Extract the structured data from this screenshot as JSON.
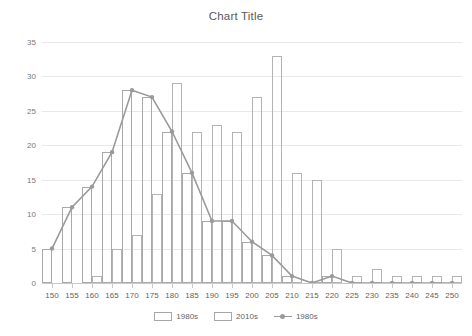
{
  "chart_data": {
    "type": "bar",
    "title": "Chart Title",
    "xlabel": "",
    "ylabel": "",
    "xlim": [
      150,
      250
    ],
    "ylim": [
      0,
      35
    ],
    "ytick_step": 5,
    "xtick_step": 5,
    "grid": true,
    "legend_position": "bottom",
    "categories": [
      150,
      155,
      160,
      165,
      170,
      175,
      180,
      185,
      190,
      195,
      200,
      205,
      210,
      215,
      220,
      225,
      230,
      235,
      240,
      245,
      250
    ],
    "yticks": [
      0,
      5,
      10,
      15,
      20,
      25,
      30,
      35
    ],
    "xticks": [
      150,
      155,
      160,
      165,
      170,
      175,
      180,
      185,
      190,
      195,
      200,
      205,
      210,
      215,
      220,
      225,
      230,
      235,
      240,
      245,
      250
    ],
    "series": [
      {
        "name": "1980s",
        "kind": "bar",
        "color": "#a9a9a9",
        "values": [
          5,
          11,
          14,
          19,
          28,
          27,
          22,
          16,
          9,
          9,
          6,
          4,
          1,
          0,
          1,
          0,
          0,
          0,
          0,
          0,
          0
        ]
      },
      {
        "name": "2010s",
        "kind": "bar",
        "color": "#b3b3b3",
        "values": [
          0,
          0,
          1,
          5,
          7,
          13,
          29,
          22,
          23,
          22,
          27,
          33,
          16,
          15,
          5,
          1,
          2,
          1,
          1,
          1,
          1
        ]
      },
      {
        "name": "1980s",
        "kind": "line",
        "color": "#9a9a9a",
        "values": [
          5,
          11,
          14,
          19,
          28,
          27,
          22,
          16,
          9,
          9,
          6,
          4,
          1,
          0,
          1,
          0,
          0,
          0,
          0,
          0,
          0
        ]
      }
    ]
  },
  "legend": {
    "items": [
      {
        "label": "1980s",
        "kind": "bar"
      },
      {
        "label": "2010s",
        "kind": "bar"
      },
      {
        "label": "1980s",
        "kind": "line"
      }
    ]
  },
  "colors": {
    "background": "#ffffff",
    "grid": "#e8e8e8",
    "axis": "#c9c9c9",
    "text": "#595959",
    "bar_1980s": "#a9a9a9",
    "bar_2010s": "#b3b3b3",
    "line_1980s": "#9a9a9a"
  }
}
